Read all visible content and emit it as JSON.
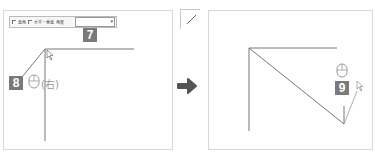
{
  "left_panel": {
    "toolbar": {
      "checkbox_1_label": "直角",
      "checkbox_2_label": "水平・垂直",
      "angle_label": "角度",
      "angle_dropdown_value": "",
      "dropdown_arrow": "▾"
    },
    "step_badge_top": "7",
    "step_badge_bottom": "8",
    "mouse_button_note": "(右)"
  },
  "mini_icon": {
    "name": "line-tool-icon"
  },
  "arrow": {
    "name": "arrow-right-icon",
    "color": "#555555"
  },
  "right_panel": {
    "step_badge": "9"
  },
  "colors": {
    "badge_bg": "#7a7a7a",
    "line": "#666666",
    "border": "#d8d8d8"
  }
}
